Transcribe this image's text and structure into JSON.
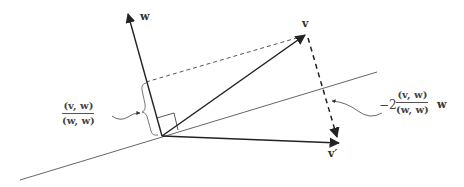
{
  "figure": {
    "vectors": {
      "w": {
        "label": "w"
      },
      "v": {
        "label": "v"
      },
      "v_prime": {
        "label": "v′"
      }
    },
    "annotations": {
      "projection_length": {
        "numerator": "(v, w)",
        "denominator": "(w, w)"
      },
      "reflection_offset": {
        "coefficient": "−2",
        "numerator": "(v, w)",
        "denominator": "(w, w)",
        "suffix": "w"
      }
    },
    "colors": {
      "stroke": "#2a2a2a",
      "mirror_line": "#555555",
      "background": "#ffffff"
    }
  }
}
